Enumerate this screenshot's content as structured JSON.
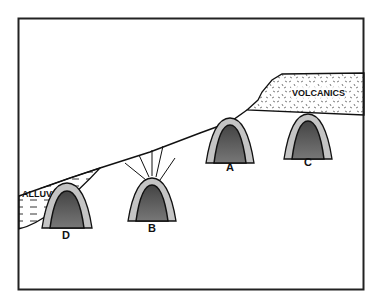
{
  "diagram": {
    "type": "geologic cross-section",
    "layers": [
      {
        "name": "alluvium",
        "label": "ALLUVIUM"
      },
      {
        "name": "volcanics",
        "label": "VOLCANICS"
      }
    ],
    "structures": [
      {
        "id": "D",
        "label": "D",
        "note": "dome beneath alluvium"
      },
      {
        "id": "B",
        "label": "B",
        "note": "dome with radiating lines to surface"
      },
      {
        "id": "A",
        "label": "A",
        "note": "dome at surface"
      },
      {
        "id": "C",
        "label": "C",
        "note": "dome beneath volcanics"
      }
    ],
    "colors": {
      "line": "#111111",
      "core": "#555555",
      "rim": "#bdbdbd",
      "background": "#ffffff"
    }
  }
}
